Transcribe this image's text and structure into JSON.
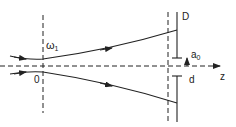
{
  "diagram": {
    "labels": {
      "waist": "ω",
      "waist_sub": "1",
      "origin": "0",
      "screen": "D",
      "aperture": "a",
      "aperture_sub": "0",
      "distance": "d",
      "axis": "z"
    },
    "colors": {
      "stroke": "#222222",
      "background": "#ffffff"
    }
  }
}
